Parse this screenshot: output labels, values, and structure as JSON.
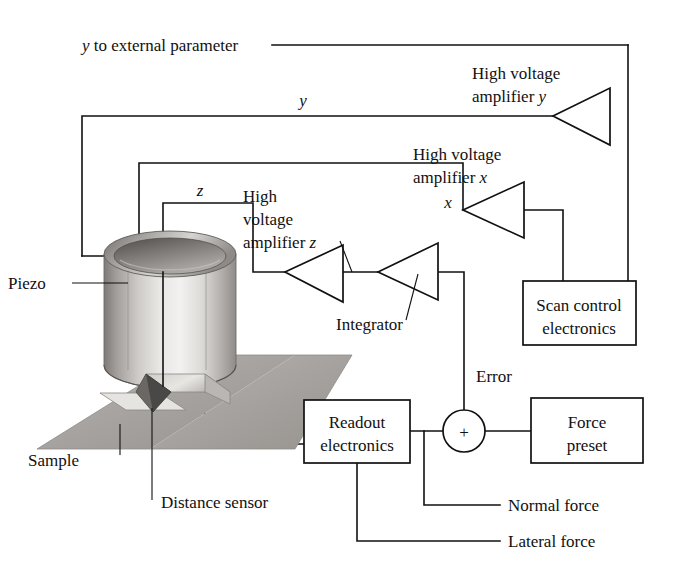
{
  "figure": {
    "background_color": "#ffffff",
    "line_color": "#111111"
  },
  "labels": {
    "y_external": "y to external parameter",
    "y_signal": "y",
    "x_signal": "x",
    "z_signal": "z",
    "hv_amp_y_line1": "High voltage",
    "hv_amp_y_line2": "amplifier y",
    "hv_amp_x_line1": "High voltage",
    "hv_amp_x_line2": "amplifier x",
    "hv_amp_z_line1": "High",
    "hv_amp_z_line2": "voltage",
    "hv_amp_z_line3": "amplifier z",
    "integrator": "Integrator",
    "piezo": "Piezo",
    "sample": "Sample",
    "distance_sensor": "Distance sensor",
    "scan_control_line1": "Scan control",
    "scan_control_line2": "electronics",
    "readout_line1": "Readout",
    "readout_line2": "electronics",
    "force_preset_line1": "Force",
    "force_preset_line2": "preset",
    "error": "Error",
    "normal_force": "Normal force",
    "lateral_force": "Lateral force",
    "sum_symbol": "+"
  },
  "colors": {
    "line": "#111111",
    "box_fill": "#ffffff",
    "sample_plate": "#a9a9a9",
    "piezo_light": "#e6e4e2",
    "piezo_mid": "#b8b5b2",
    "piezo_dark": "#6e6b68",
    "tip_dark": "#4a4846"
  },
  "components": [
    {
      "name": "high-voltage-amplifier-y",
      "kind": "triangle",
      "label": "High voltage amplifier y"
    },
    {
      "name": "high-voltage-amplifier-x",
      "kind": "triangle",
      "label": "High voltage amplifier x"
    },
    {
      "name": "high-voltage-amplifier-z",
      "kind": "triangle",
      "label": "High voltage amplifier z"
    },
    {
      "name": "integrator",
      "kind": "triangle",
      "label": "Integrator"
    },
    {
      "name": "scan-control-electronics",
      "kind": "box",
      "label": "Scan control electronics"
    },
    {
      "name": "readout-electronics",
      "kind": "box",
      "label": "Readout electronics"
    },
    {
      "name": "force-preset",
      "kind": "box",
      "label": "Force preset"
    },
    {
      "name": "summing-junction",
      "kind": "circle",
      "label": "+"
    },
    {
      "name": "piezo-tube",
      "kind": "illustration",
      "label": "Piezo"
    },
    {
      "name": "sample-plate",
      "kind": "illustration",
      "label": "Sample"
    },
    {
      "name": "distance-sensor",
      "kind": "illustration",
      "label": "Distance sensor"
    }
  ]
}
